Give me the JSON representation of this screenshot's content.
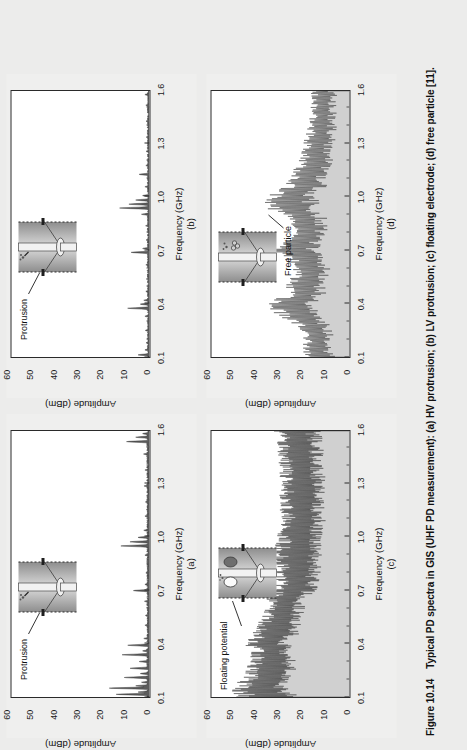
{
  "figure": {
    "number": "Figure 10.14",
    "caption": "Typical PD spectra in GIS (UHF PD measurement): (a) HV protrusion; (b) LV protrusion; (c) floating electrode; (d) free particle [11]."
  },
  "axis": {
    "xlabel": "Frequency (GHz)",
    "ylabel": "Amplitude (dBm)",
    "xticks": [
      "0.1",
      "0.4",
      "0.7",
      "1.0",
      "1.3",
      "1.6"
    ],
    "yticks": [
      "0",
      "10",
      "20",
      "30",
      "40",
      "50",
      "60"
    ]
  },
  "panels": [
    {
      "key": "a",
      "letter": "(a)",
      "annotation": "Protrusion",
      "inset": "gis-hv-protrusion-icon"
    },
    {
      "key": "b",
      "letter": "(b)",
      "annotation": "Protrusion",
      "inset": "gis-lv-protrusion-icon"
    },
    {
      "key": "c",
      "letter": "(c)",
      "annotation": "Floating potential",
      "inset": "gis-floating-electrode-icon"
    },
    {
      "key": "d",
      "letter": "(d)",
      "annotation": "Free particle",
      "inset": "gis-free-particle-icon"
    }
  ],
  "chart_data": [
    {
      "id": "a",
      "type": "line",
      "title": "(a) HV protrusion",
      "xlabel": "Frequency (GHz)",
      "ylabel": "Amplitude (dBm)",
      "xlim": [
        0.1,
        1.6
      ],
      "ylim": [
        0,
        60
      ],
      "xticks": [
        0.1,
        0.4,
        0.7,
        1.0,
        1.3,
        1.6
      ],
      "yticks": [
        0,
        10,
        20,
        30,
        40,
        50,
        60
      ],
      "grid": false,
      "legend": null,
      "annotations": [
        "Protrusion"
      ],
      "description": "Sparse narrow spectral lines on a near-zero noise floor; strongest cluster below 0.35 GHz.",
      "noise_floor": 1.0,
      "peaks": [
        {
          "x": 0.115,
          "y": 14.5
        },
        {
          "x": 0.128,
          "y": 5.0
        },
        {
          "x": 0.15,
          "y": 17.5
        },
        {
          "x": 0.163,
          "y": 6.0
        },
        {
          "x": 0.183,
          "y": 3.5
        },
        {
          "x": 0.21,
          "y": 11.0
        },
        {
          "x": 0.232,
          "y": 4.0
        },
        {
          "x": 0.262,
          "y": 8.5
        },
        {
          "x": 0.3,
          "y": 4.5
        },
        {
          "x": 0.338,
          "y": 12.0
        },
        {
          "x": 0.36,
          "y": 3.0
        },
        {
          "x": 0.392,
          "y": 9.5
        },
        {
          "x": 0.43,
          "y": 2.5
        },
        {
          "x": 0.505,
          "y": 2.0
        },
        {
          "x": 0.56,
          "y": 1.8
        },
        {
          "x": 0.64,
          "y": 2.2
        },
        {
          "x": 0.7,
          "y": 7.0
        },
        {
          "x": 0.735,
          "y": 2.0
        },
        {
          "x": 0.8,
          "y": 1.6
        },
        {
          "x": 0.9,
          "y": 2.0
        },
        {
          "x": 0.952,
          "y": 12.5
        },
        {
          "x": 0.975,
          "y": 8.5
        },
        {
          "x": 1.0,
          "y": 5.0
        },
        {
          "x": 1.04,
          "y": 2.5
        },
        {
          "x": 1.12,
          "y": 2.0
        },
        {
          "x": 1.2,
          "y": 1.8
        },
        {
          "x": 1.29,
          "y": 2.4
        },
        {
          "x": 1.38,
          "y": 2.0
        },
        {
          "x": 1.47,
          "y": 2.6
        },
        {
          "x": 1.54,
          "y": 10.0
        },
        {
          "x": 1.565,
          "y": 6.0
        },
        {
          "x": 1.585,
          "y": 3.0
        }
      ]
    },
    {
      "id": "b",
      "type": "line",
      "title": "(b) LV protrusion",
      "xlabel": "Frequency (GHz)",
      "ylabel": "Amplitude (dBm)",
      "xlim": [
        0.1,
        1.6
      ],
      "ylim": [
        0,
        60
      ],
      "xticks": [
        0.1,
        0.4,
        0.7,
        1.0,
        1.3,
        1.6
      ],
      "yticks": [
        0,
        10,
        20,
        30,
        40,
        50,
        60
      ],
      "grid": false,
      "legend": null,
      "annotations": [
        "Protrusion"
      ],
      "description": "Very sparse discrete lines; dominant cluster near 0.95-1.0 GHz and a line near 0.4 GHz.",
      "noise_floor": 0.8,
      "peaks": [
        {
          "x": 0.112,
          "y": 5.0
        },
        {
          "x": 0.14,
          "y": 2.0
        },
        {
          "x": 0.18,
          "y": 1.5
        },
        {
          "x": 0.25,
          "y": 1.8
        },
        {
          "x": 0.33,
          "y": 2.0
        },
        {
          "x": 0.375,
          "y": 9.5
        },
        {
          "x": 0.398,
          "y": 4.0
        },
        {
          "x": 0.42,
          "y": 2.5
        },
        {
          "x": 0.47,
          "y": 1.6
        },
        {
          "x": 0.54,
          "y": 1.4
        },
        {
          "x": 0.62,
          "y": 1.6
        },
        {
          "x": 0.69,
          "y": 8.0
        },
        {
          "x": 0.712,
          "y": 3.0
        },
        {
          "x": 0.76,
          "y": 1.5
        },
        {
          "x": 0.84,
          "y": 1.7
        },
        {
          "x": 0.905,
          "y": 3.5
        },
        {
          "x": 0.94,
          "y": 13.0
        },
        {
          "x": 0.962,
          "y": 9.0
        },
        {
          "x": 0.985,
          "y": 6.0
        },
        {
          "x": 1.01,
          "y": 3.0
        },
        {
          "x": 1.06,
          "y": 2.0
        },
        {
          "x": 1.13,
          "y": 4.5
        },
        {
          "x": 1.18,
          "y": 1.6
        },
        {
          "x": 1.26,
          "y": 1.5
        },
        {
          "x": 1.34,
          "y": 1.4
        },
        {
          "x": 1.43,
          "y": 1.5
        },
        {
          "x": 1.52,
          "y": 1.6
        },
        {
          "x": 1.58,
          "y": 2.0
        }
      ]
    },
    {
      "id": "c",
      "type": "line",
      "title": "(c) Floating electrode",
      "xlabel": "Frequency (GHz)",
      "ylabel": "Amplitude (dBm)",
      "xlim": [
        0.1,
        1.6
      ],
      "ylim": [
        0,
        60
      ],
      "xticks": [
        0.1,
        0.4,
        0.7,
        1.0,
        1.3,
        1.6
      ],
      "yticks": [
        0,
        10,
        20,
        30,
        40,
        50,
        60
      ],
      "grid": false,
      "legend": null,
      "annotations": [
        "Floating potential"
      ],
      "description": "Dense broadband noise-like spectrum filling the plot; envelope ~50 dBm near 0.12 GHz falling to ~20 dBm at 1.6 GHz.",
      "envelope": {
        "x": [
          0.1,
          0.15,
          0.2,
          0.25,
          0.3,
          0.35,
          0.4,
          0.45,
          0.5,
          0.55,
          0.6,
          0.65,
          0.7,
          0.8,
          0.9,
          1.0,
          1.1,
          1.2,
          1.3,
          1.4,
          1.5,
          1.6
        ],
        "upper": [
          48,
          52,
          46,
          44,
          43,
          42,
          45,
          42,
          40,
          38,
          37,
          36,
          33,
          31,
          32,
          31,
          29,
          30,
          29,
          30,
          31,
          33
        ],
        "lower": [
          22,
          26,
          25,
          24,
          24,
          25,
          26,
          23,
          22,
          21,
          20,
          19,
          15,
          13,
          13,
          12,
          11,
          12,
          11,
          12,
          12,
          13
        ]
      }
    },
    {
      "id": "d",
      "type": "line",
      "title": "(d) Free particle",
      "xlabel": "Frequency (GHz)",
      "ylabel": "Amplitude (dBm)",
      "xlim": [
        0.1,
        1.6
      ],
      "ylim": [
        0,
        60
      ],
      "xticks": [
        0.1,
        0.4,
        0.7,
        1.0,
        1.3,
        1.6
      ],
      "yticks": [
        0,
        10,
        20,
        30,
        40,
        50,
        60
      ],
      "grid": false,
      "legend": null,
      "annotations": [
        "Free particle"
      ],
      "description": "Moderately dense noise-like spectrum; local maxima near 0.38, 0.70 and 0.97 GHz, decaying above 1.1 GHz.",
      "envelope": {
        "x": [
          0.1,
          0.15,
          0.2,
          0.25,
          0.3,
          0.35,
          0.4,
          0.45,
          0.5,
          0.55,
          0.6,
          0.65,
          0.7,
          0.75,
          0.8,
          0.85,
          0.9,
          0.95,
          1.0,
          1.05,
          1.1,
          1.2,
          1.3,
          1.4,
          1.5,
          1.6
        ],
        "upper": [
          18,
          22,
          20,
          21,
          26,
          32,
          36,
          28,
          27,
          26,
          25,
          28,
          37,
          30,
          26,
          27,
          30,
          37,
          36,
          29,
          26,
          22,
          20,
          18,
          17,
          17
        ],
        "lower": [
          6,
          8,
          7,
          8,
          10,
          12,
          14,
          11,
          10,
          10,
          9,
          10,
          13,
          12,
          10,
          10,
          11,
          14,
          14,
          11,
          10,
          8,
          7,
          6,
          6,
          6
        ]
      }
    }
  ]
}
